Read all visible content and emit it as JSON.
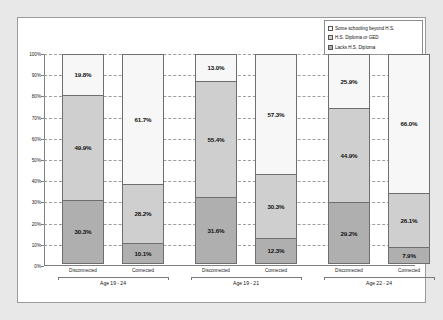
{
  "chart_data": {
    "type": "bar",
    "subtype": "stacked-percentage-column",
    "title": "",
    "xlabel": "",
    "ylabel": "",
    "ylim": [
      0,
      100
    ],
    "ytick_labels": [
      "0%",
      "10%",
      "20%",
      "30%",
      "40%",
      "50%",
      "60%",
      "70%",
      "80%",
      "90%",
      "100%"
    ],
    "ytick_values": [
      0,
      10,
      20,
      30,
      40,
      50,
      60,
      70,
      80,
      90,
      100
    ],
    "grid": true,
    "grid_style": "dashed-horizontal",
    "legend_position": "top-right",
    "categories": [
      "Disconnected",
      "Connected",
      "Disconnected",
      "Connected",
      "Disconnected",
      "Connected"
    ],
    "groups": [
      {
        "label": "Age 19 - 24",
        "categories": [
          "Disconnected",
          "Connected"
        ]
      },
      {
        "label": "Age 19 - 21",
        "categories": [
          "Disconnected",
          "Connected"
        ]
      },
      {
        "label": "Age 22 - 24",
        "categories": [
          "Disconnected",
          "Connected"
        ]
      }
    ],
    "series": [
      {
        "name": "Some schooling beyond H.S.",
        "color": "#f7f7f7",
        "values": [
          19.8,
          61.7,
          13.0,
          57.3,
          25.9,
          66.0
        ],
        "labels": [
          "19.8%",
          "61.7%",
          "13.0%",
          "57.3%",
          "25.9%",
          "66.0%"
        ]
      },
      {
        "name": "H.S. Diploma or GED",
        "color": "#cfcfcf",
        "values": [
          49.9,
          28.2,
          55.4,
          30.3,
          44.9,
          26.1
        ],
        "labels": [
          "49.9%",
          "28.2%",
          "55.4%",
          "30.3%",
          "44.9%",
          "26.1%"
        ]
      },
      {
        "name": "Lacks H.S. Diploma",
        "color": "#afafaf",
        "values": [
          30.3,
          10.1,
          31.6,
          12.3,
          29.2,
          7.9
        ],
        "labels": [
          "30.3%",
          "10.1%",
          "31.6%",
          "12.3%",
          "29.2%",
          "7.9%"
        ]
      }
    ]
  },
  "legend": {
    "items": [
      {
        "label": "Some schooling beyond H.S.",
        "color": "#f7f7f7"
      },
      {
        "label": "H.S. Diploma or GED",
        "color": "#cfcfcf"
      },
      {
        "label": "Lacks H.S. Diploma",
        "color": "#afafaf"
      }
    ]
  }
}
